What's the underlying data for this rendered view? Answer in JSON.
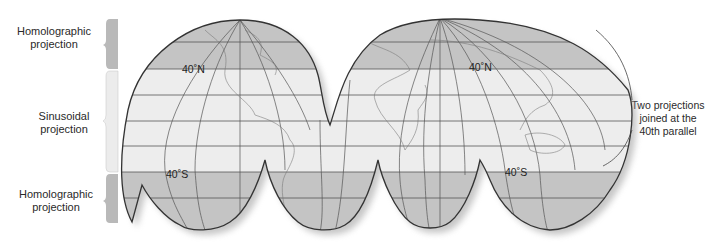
{
  "labels": {
    "top": {
      "line1": "Homolographic",
      "line2": "projection"
    },
    "middle": {
      "line1": "Sinusoidal",
      "line2": "projection"
    },
    "bottom": {
      "line1": "Homolographic",
      "line2": "projection"
    },
    "callout": {
      "line1": "Two projections",
      "line2": "joined at the",
      "line3": "40th parallel"
    }
  },
  "parallels": {
    "n1": "40˚N",
    "n2": "40˚N",
    "s1": "40˚S",
    "s2": "40˚S"
  },
  "colors": {
    "homolographic_band": "#c4c4c4",
    "sinusoidal_band": "#ededed",
    "outline": "#333333",
    "grid": "#555555",
    "brace_dark": "#b9b9b9",
    "brace_light": "#ececec"
  }
}
